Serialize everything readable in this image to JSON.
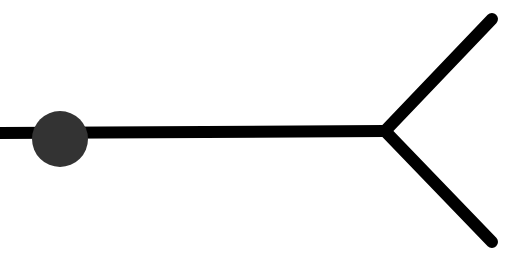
{
  "diagram": {
    "type": "fork-path",
    "background": "#ffffff",
    "line_color": "#000000",
    "line_width": 12,
    "stem": {
      "x1": 0,
      "y1": 133,
      "x2": 385,
      "y2": 131
    },
    "branches": [
      {
        "name": "upper",
        "x1": 385,
        "y1": 131,
        "x2": 492,
        "y2": 19
      },
      {
        "name": "lower",
        "x1": 385,
        "y1": 131,
        "x2": 492,
        "y2": 242
      }
    ],
    "marker": {
      "cx": 60,
      "cy": 139,
      "r": 28,
      "color": "#333333"
    }
  }
}
